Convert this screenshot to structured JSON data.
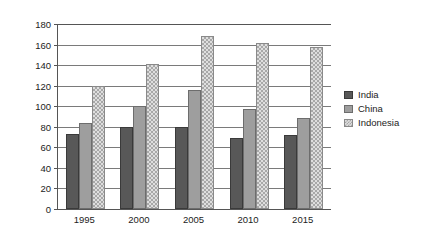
{
  "chart_data": {
    "type": "bar",
    "title": "",
    "subtitle": "",
    "xlabel": "",
    "ylabel": "Kilograms/year",
    "categories": [
      "1995",
      "2000",
      "2005",
      "2010",
      "2015"
    ],
    "series": [
      {
        "name": "India",
        "values": [
          73,
          80,
          80,
          69,
          72
        ],
        "color": "#585858",
        "fill": "solid-dark-gray"
      },
      {
        "name": "China",
        "values": [
          84,
          100,
          116,
          97,
          89
        ],
        "color": "#9e9e9e",
        "fill": "solid-medium-gray"
      },
      {
        "name": "Indonesia",
        "values": [
          120,
          141,
          168,
          162,
          158
        ],
        "color": "#dedede",
        "fill": "checkered-light-gray"
      }
    ],
    "ylim": [
      0,
      180
    ],
    "ytick_step": 20,
    "ytick_labels": [
      "0",
      "20",
      "40",
      "60",
      "80",
      "100",
      "120",
      "140",
      "160",
      "180"
    ],
    "xtick_labels": [
      "1995",
      "2000",
      "2005",
      "2010",
      "2015"
    ],
    "grid": true,
    "grid_axis": "y",
    "legend_position": "right",
    "legend_entries": [
      "India",
      "China",
      "Indonesia"
    ],
    "annotations": []
  },
  "axes": {
    "y_title": "Kilograms/year"
  },
  "legend": {
    "items": [
      {
        "label": "India"
      },
      {
        "label": "China"
      },
      {
        "label": "Indonesia"
      }
    ]
  },
  "watermark": {
    "text": ""
  }
}
